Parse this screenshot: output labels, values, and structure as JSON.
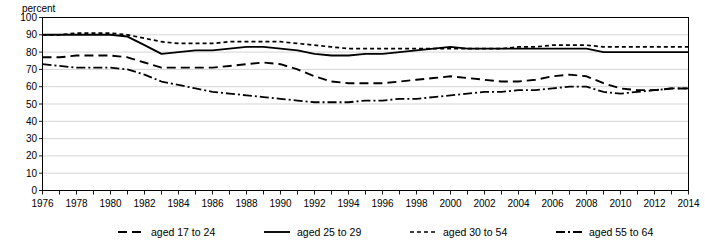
{
  "chart_data": {
    "type": "line",
    "title": "",
    "ylabel": "percent",
    "xlabel": "",
    "ylim": [
      0,
      100
    ],
    "ytick_step": 10,
    "yticks": [
      0,
      10,
      20,
      30,
      40,
      50,
      60,
      70,
      80,
      90,
      100
    ],
    "xlim": [
      1976,
      2014
    ],
    "xticks": [
      1976,
      1978,
      1980,
      1982,
      1984,
      1986,
      1988,
      1990,
      1992,
      1994,
      1996,
      1998,
      2000,
      2002,
      2004,
      2006,
      2008,
      2010,
      2012,
      2014
    ],
    "xtick_labels": [
      "1976",
      "1978",
      "1980",
      "1982",
      "1984",
      "1986",
      "1988",
      "1990",
      "1992",
      "1994",
      "1996",
      "1998",
      "2000",
      "2002",
      "2004",
      "2006",
      "2008",
      "2010",
      "2012",
      "2014"
    ],
    "x": [
      1976,
      1977,
      1978,
      1979,
      1980,
      1981,
      1982,
      1983,
      1984,
      1985,
      1986,
      1987,
      1988,
      1989,
      1990,
      1991,
      1992,
      1993,
      1994,
      1995,
      1996,
      1997,
      1998,
      1999,
      2000,
      2001,
      2002,
      2003,
      2004,
      2005,
      2006,
      2007,
      2008,
      2009,
      2010,
      2011,
      2012,
      2013,
      2014
    ],
    "grid": true,
    "legend_position": "bottom",
    "series": [
      {
        "name": "aged 17 to 24",
        "style": "dashed",
        "color": "#000000",
        "values": [
          77,
          77,
          78,
          78,
          78,
          77,
          74,
          71,
          71,
          71,
          71,
          72,
          73,
          74,
          73,
          70,
          66,
          63,
          62,
          62,
          62,
          63,
          64,
          65,
          66,
          65,
          64,
          63,
          63,
          64,
          66,
          67,
          66,
          62,
          59,
          58,
          58,
          59,
          59
        ]
      },
      {
        "name": "aged 25 to 29",
        "style": "solid",
        "color": "#000000",
        "values": [
          90,
          90,
          90,
          90,
          90,
          89,
          84,
          79,
          80,
          81,
          81,
          82,
          83,
          83,
          82,
          81,
          79,
          78,
          78,
          79,
          79,
          80,
          81,
          82,
          83,
          82,
          82,
          82,
          82,
          82,
          82,
          82,
          82,
          80,
          80,
          80,
          80,
          80,
          80
        ]
      },
      {
        "name": "aged 30 to 54",
        "style": "fine-dashed",
        "color": "#000000",
        "values": [
          90,
          90,
          91,
          91,
          91,
          90,
          88,
          86,
          85,
          85,
          85,
          86,
          86,
          86,
          86,
          85,
          84,
          83,
          82,
          82,
          82,
          82,
          82,
          82,
          82,
          82,
          82,
          82,
          83,
          83,
          84,
          84,
          84,
          83,
          83,
          83,
          83,
          83,
          83
        ]
      },
      {
        "name": "aged 55 to 64",
        "style": "dash-dot",
        "color": "#000000",
        "values": [
          73,
          72,
          71,
          71,
          71,
          70,
          67,
          63,
          61,
          59,
          57,
          56,
          55,
          54,
          53,
          52,
          51,
          51,
          51,
          52,
          52,
          53,
          53,
          54,
          55,
          56,
          57,
          57,
          58,
          58,
          59,
          60,
          60,
          57,
          56,
          57,
          58,
          59,
          59
        ]
      }
    ],
    "legend": [
      {
        "label": "aged 17 to 24",
        "style": "dashed"
      },
      {
        "label": "aged 25 to 29",
        "style": "solid"
      },
      {
        "label": "aged 30 to 54",
        "style": "fine-dashed"
      },
      {
        "label": "aged 55 to 64",
        "style": "dash-dot"
      }
    ]
  }
}
